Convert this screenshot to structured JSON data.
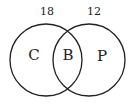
{
  "diagram": {
    "type": "venn",
    "counts": {
      "left": "18",
      "right": "12"
    },
    "regions": {
      "left": "C",
      "overlap": "B",
      "right": "P"
    },
    "colors": {
      "stroke": "#222222",
      "text": "#222222",
      "background": "#ffffff"
    }
  }
}
